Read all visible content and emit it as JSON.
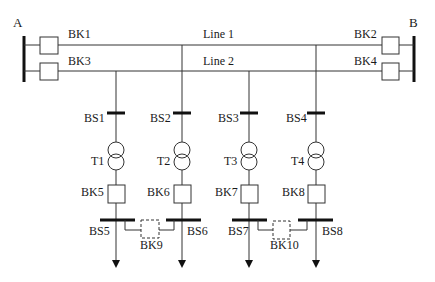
{
  "diagram": {
    "type": "single-line electrical substation diagram",
    "buses": {
      "A": "A",
      "B": "B"
    },
    "lines": [
      "Line 1",
      "Line 2"
    ],
    "line_breakers": [
      "BK1",
      "BK2",
      "BK3",
      "BK4"
    ],
    "branches": [
      {
        "busbar": "BS1",
        "transformer": "T1",
        "breaker": "BK5",
        "lv_bus": "BS5",
        "feed_from": "Line 2"
      },
      {
        "busbar": "BS2",
        "transformer": "T2",
        "breaker": "BK6",
        "lv_bus": "BS6",
        "feed_from": "Line 1"
      },
      {
        "busbar": "BS3",
        "transformer": "T3",
        "breaker": "BK7",
        "lv_bus": "BS7",
        "feed_from": "Line 2"
      },
      {
        "busbar": "BS4",
        "transformer": "T4",
        "breaker": "BK8",
        "lv_bus": "BS8",
        "feed_from": "Line 1"
      }
    ],
    "tie_breakers": [
      "BK9",
      "BK10"
    ],
    "colors": {
      "line": "#333333",
      "bus": "#111111",
      "background": "#ffffff"
    }
  }
}
